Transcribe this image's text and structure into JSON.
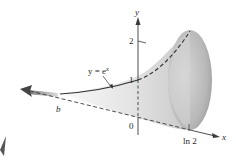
{
  "figure": {
    "curve_label": "y = e",
    "curve_label_exponent": "x",
    "axis_x_label": "x",
    "axis_y_label": "y",
    "y_ticks": [
      {
        "value": 1,
        "label": "1"
      },
      {
        "value": 2,
        "label": "2"
      }
    ],
    "origin_label": "0",
    "x_marks": [
      {
        "label": "b"
      },
      {
        "label": "ln 2"
      }
    ],
    "colors": {
      "surface_light": "#f2f2f2",
      "surface_dark": "#9a9a9a",
      "curve": "#333333",
      "axis": "#3a3a3a"
    }
  }
}
